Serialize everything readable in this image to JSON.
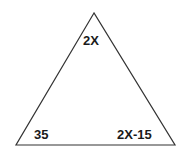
{
  "diagram": {
    "type": "triangle",
    "stroke_color": "#333333",
    "background": "#ffffff",
    "vertices": {
      "top": [
        94,
        13
      ],
      "bottom_left": [
        16,
        145
      ],
      "bottom_right": [
        175,
        145
      ]
    },
    "angles": {
      "top": "2X",
      "bottom_left": "35",
      "bottom_right": "2X-15"
    }
  }
}
